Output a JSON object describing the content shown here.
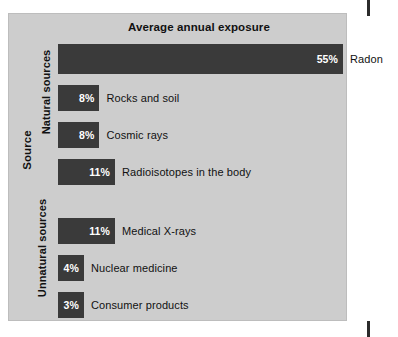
{
  "chart_data": {
    "type": "bar",
    "title": "Average annual exposure",
    "xlabel": "",
    "ylabel": "Source",
    "orientation": "horizontal",
    "grid": false,
    "legend": "none",
    "xlim": [
      0,
      55
    ],
    "value_suffix": "%",
    "groups": [
      {
        "name": "Natural sources",
        "items": [
          {
            "label": "Radon",
            "value": 55,
            "value_text": "55%"
          },
          {
            "label": "Rocks and soil",
            "value": 8,
            "value_text": "8%"
          },
          {
            "label": "Cosmic rays",
            "value": 8,
            "value_text": "8%"
          },
          {
            "label": "Radioisotopes in the body",
            "value": 11,
            "value_text": "11%"
          }
        ]
      },
      {
        "name": "Unnatural sources",
        "items": [
          {
            "label": "Medical X-rays",
            "value": 11,
            "value_text": "11%"
          },
          {
            "label": "Nuclear medicine",
            "value": 4,
            "value_text": "4%"
          },
          {
            "label": "Consumer products",
            "value": 3,
            "value_text": "3%"
          }
        ]
      }
    ],
    "categories": [
      "Radon",
      "Rocks and soil",
      "Cosmic rays",
      "Radioisotopes in the body",
      "Medical X-rays",
      "Nuclear medicine",
      "Consumer products"
    ],
    "values": [
      55,
      8,
      8,
      11,
      11,
      4,
      3
    ],
    "colors": {
      "bar_fill": "#3a3a3a",
      "panel_background": "#cdcdcd",
      "page_background": "#ffffff",
      "value_text": "#ffffff",
      "label_text": "#111111",
      "registration_mark": "#2b2b2b"
    }
  }
}
